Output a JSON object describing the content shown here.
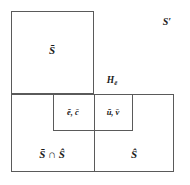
{
  "figure": {
    "type": "set-partition-diagram",
    "width": 190,
    "height": 185,
    "background_color": "#ffffff",
    "line_color": "#5a5a5a",
    "text_color": "#1a1a1a"
  },
  "labels": {
    "universe": "S′",
    "top_left_region": "S̄",
    "bottom_left_region": "S̄ ∩ Ŝ",
    "bottom_right_region": "Ŝ",
    "inner_left_cell": "ē, c̄",
    "inner_right_cell": "ū, v̄",
    "hyperplane_base": "H",
    "hyperplane_subscript": "ē"
  },
  "regions": [
    {
      "name": "top-left-square",
      "label": "S̄",
      "x": 11,
      "y": 11,
      "width": 83,
      "height": 83
    },
    {
      "name": "bottom-left-rect",
      "label": "S̄ ∩ Ŝ",
      "x": 11,
      "y": 94,
      "width": 83,
      "height": 78
    },
    {
      "name": "bottom-right-rect",
      "label": "Ŝ",
      "x": 94,
      "y": 94,
      "width": 80,
      "height": 78
    },
    {
      "name": "inner-left-cell",
      "label": "ē, c̄",
      "x": 53,
      "y": 94,
      "width": 41,
      "height": 37
    },
    {
      "name": "inner-right-cell",
      "label": "ū, v̄",
      "x": 94,
      "y": 94,
      "width": 39,
      "height": 37
    }
  ],
  "label_positions": {
    "top_left_region": {
      "x": 52,
      "y": 50
    },
    "bottom_left_region": {
      "x": 52,
      "y": 154
    },
    "bottom_right_region": {
      "x": 134,
      "y": 154
    },
    "inner_left_cell": {
      "x": 73,
      "y": 112
    },
    "inner_right_cell": {
      "x": 113,
      "y": 112
    },
    "hyperplane": {
      "x": 112,
      "y": 81
    },
    "universe": {
      "x": 167,
      "y": 22
    }
  }
}
